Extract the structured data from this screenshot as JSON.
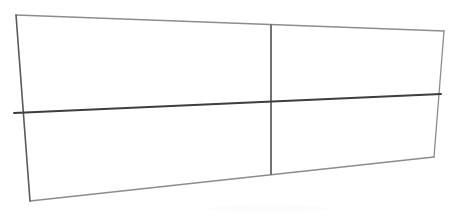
{
  "scene": {
    "title": "Quadrilateral panel grid",
    "description": "Hand-drawn four-panel rectangular frame shown in slight perspective",
    "background_color": "#ffffff",
    "width": 456,
    "height": 216
  },
  "palette": {
    "outline_light": "#8c8c8c",
    "outline_medium": "#5a5a5a",
    "divider_dark": "#3d3d3d",
    "background": "#ffffff",
    "smudge": "#fcfcfc"
  },
  "geometry": {
    "outer_quad": {
      "top_left": [
        16,
        15
      ],
      "top_right": [
        444,
        31
      ],
      "bottom_right": [
        434,
        157
      ],
      "bottom_left": [
        30,
        201
      ],
      "points": "16,15 444,31 434,157 30,201"
    },
    "edges": [
      {
        "name": "top-edge",
        "d": "M 16 15 L 444 31",
        "color": "#8c8c8c",
        "width": 1.3
      },
      {
        "name": "right-edge",
        "d": "M 444 31 L 434 157",
        "color": "#8c8c8c",
        "width": 1.3
      },
      {
        "name": "bottom-edge",
        "d": "M 434 157 L 30 201",
        "color": "#8c8c8c",
        "width": 1.3
      },
      {
        "name": "left-edge",
        "d": "M 16 15 L 30 201",
        "color": "#5a5a5a",
        "width": 1.6
      }
    ],
    "dividers": [
      {
        "name": "horizontal-divider",
        "d": "M 14 113 L 441 94",
        "color": "#3d3d3d",
        "width": 1.9
      },
      {
        "name": "vertical-divider",
        "d": "M 271 25 L 271 174",
        "color": "#5a5a5a",
        "width": 1.7
      }
    ]
  },
  "panels": [
    {
      "id": "panel-top-left",
      "label": "",
      "points": "16,15 271,25 271,102 15,110"
    },
    {
      "id": "panel-top-right",
      "label": "",
      "points": "271,25 444,31 441,95 271,102"
    },
    {
      "id": "panel-bottom-left",
      "label": "",
      "points": "15,110 271,102 271,174 30,201"
    },
    {
      "id": "panel-bottom-right",
      "label": "",
      "points": "271,102 441,95 434,157 271,174"
    }
  ],
  "marks": [
    {
      "name": "faint-smudge",
      "cx": 268,
      "cy": 209,
      "rx": 60,
      "ry": 4
    }
  ]
}
